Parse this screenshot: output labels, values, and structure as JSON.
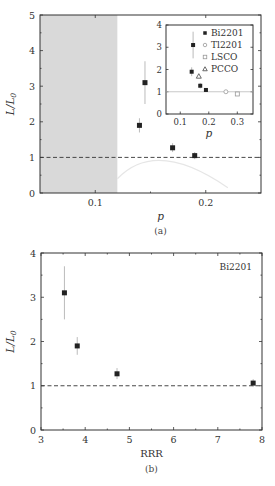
{
  "chart_data": [
    {
      "id": "a",
      "type": "scatter",
      "caption": "(a)",
      "xlabel": "p",
      "ylabel": "L/L0",
      "xlim": [
        0.05,
        0.25
      ],
      "ylim": [
        0,
        5
      ],
      "xticks": [
        0.1,
        0.2
      ],
      "xtick_labels": [
        "0.1",
        "0.2"
      ],
      "yticks": [
        0,
        1,
        2,
        3,
        4,
        5
      ],
      "ytick_labels": [
        "0",
        "1",
        "2",
        "3",
        "4",
        "5"
      ],
      "shaded_region": {
        "x_from": 0.05,
        "x_to": 0.12,
        "color": "#d9d9d9"
      },
      "reference_line": {
        "y": 1,
        "style": "dashed"
      },
      "series": [
        {
          "name": "Bi2201",
          "marker": "filled-square",
          "x": [
            0.14,
            0.145,
            0.17,
            0.19
          ],
          "y": [
            1.9,
            3.1,
            1.27,
            1.05
          ],
          "yerr_low": [
            1.7,
            2.5,
            1.15,
            0.95
          ],
          "yerr_high": [
            2.1,
            3.7,
            1.4,
            1.15
          ]
        }
      ],
      "inset": {
        "xlabel": "p",
        "xlim": [
          0.05,
          0.355
        ],
        "ylim": [
          0,
          4
        ],
        "xticks": [
          0.1,
          0.2,
          0.3
        ],
        "xtick_labels": [
          "0.1",
          "0.2",
          "0.3"
        ],
        "yticks": [
          0,
          1,
          2,
          3,
          4
        ],
        "ytick_labels": [
          "0",
          "1",
          "2",
          "3",
          "4"
        ],
        "reference_line": {
          "y": 1,
          "style": "solid-grey"
        },
        "legend": [
          "Bi2201",
          "Tl2201",
          "LSCO",
          "PCCO"
        ],
        "series": [
          {
            "name": "Bi2201",
            "marker": "filled-square",
            "x": [
              0.14,
              0.145,
              0.17,
              0.19
            ],
            "y": [
              1.9,
              3.1,
              1.27,
              1.08
            ],
            "yerr_low": [
              1.7,
              2.5,
              1.15,
              1.0
            ],
            "yerr_high": [
              2.1,
              3.7,
              1.4,
              1.15
            ]
          },
          {
            "name": "Tl2201",
            "marker": "open-circle",
            "x": [
              0.26
            ],
            "y": [
              1.0
            ]
          },
          {
            "name": "LSCO",
            "marker": "open-square",
            "x": [
              0.3
            ],
            "y": [
              0.9
            ]
          },
          {
            "name": "PCCO",
            "marker": "open-triangle",
            "x": [
              0.165
            ],
            "y": [
              1.7
            ]
          }
        ]
      }
    },
    {
      "id": "b",
      "type": "scatter",
      "caption": "(b)",
      "title": "Bi2201",
      "xlabel": "RRR",
      "ylabel": "L/L0",
      "xlim": [
        3,
        8
      ],
      "ylim": [
        0,
        4
      ],
      "xticks": [
        3,
        4,
        5,
        6,
        7,
        8
      ],
      "xtick_labels": [
        "3",
        "4",
        "5",
        "6",
        "7",
        "8"
      ],
      "yticks": [
        0,
        1,
        2,
        3,
        4
      ],
      "ytick_labels": [
        "0",
        "1",
        "2",
        "3",
        "4"
      ],
      "reference_line": {
        "y": 1,
        "style": "dashed"
      },
      "series": [
        {
          "name": "Bi2201",
          "marker": "filled-square",
          "x": [
            3.53,
            3.82,
            4.72,
            7.8
          ],
          "y": [
            3.1,
            1.9,
            1.27,
            1.06
          ],
          "yerr_low": [
            2.5,
            1.7,
            1.15,
            0.97
          ],
          "yerr_high": [
            3.7,
            2.1,
            1.4,
            1.15
          ]
        }
      ]
    }
  ],
  "labels": {
    "caption_a": "(a)",
    "caption_b": "(b)",
    "xlabel_a": "p",
    "xlabel_b": "RRR",
    "inset_xlabel": "p",
    "title_b": "Bi2201",
    "ylabel_main": "L/L",
    "ylabel_sub": "0"
  }
}
